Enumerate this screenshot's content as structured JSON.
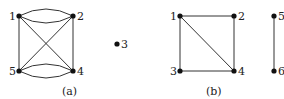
{
  "graphs": [
    {
      "caption": "(a)",
      "nodes": [
        {
          "id": "1",
          "label": "1",
          "x": 19,
          "y": 16
        },
        {
          "id": "2",
          "label": "2",
          "x": 73,
          "y": 16
        },
        {
          "id": "3",
          "label": "3",
          "x": 117,
          "y": 44
        },
        {
          "id": "4",
          "label": "4",
          "x": 73,
          "y": 71
        },
        {
          "id": "5",
          "label": "5",
          "x": 19,
          "y": 71
        }
      ],
      "edges": [
        {
          "from": "1",
          "to": "2",
          "type": "curve-up"
        },
        {
          "from": "1",
          "to": "2",
          "type": "curve-down"
        },
        {
          "from": "5",
          "to": "4",
          "type": "curve-up"
        },
        {
          "from": "5",
          "to": "4",
          "type": "curve-down"
        },
        {
          "from": "1",
          "to": "5",
          "type": "line"
        },
        {
          "from": "2",
          "to": "4",
          "type": "line"
        },
        {
          "from": "1",
          "to": "4",
          "type": "line"
        },
        {
          "from": "2",
          "to": "5",
          "type": "line"
        }
      ]
    },
    {
      "caption": "(b)",
      "nodes": [
        {
          "id": "1",
          "label": "1",
          "x": 180,
          "y": 16
        },
        {
          "id": "2",
          "label": "2",
          "x": 234,
          "y": 16
        },
        {
          "id": "3",
          "label": "3",
          "x": 180,
          "y": 71
        },
        {
          "id": "4",
          "label": "4",
          "x": 234,
          "y": 71
        },
        {
          "id": "5",
          "label": "5",
          "x": 274,
          "y": 16
        },
        {
          "id": "6",
          "label": "6",
          "x": 274,
          "y": 71
        }
      ],
      "edges": [
        {
          "from": "1",
          "to": "2",
          "type": "line"
        },
        {
          "from": "1",
          "to": "3",
          "type": "line"
        },
        {
          "from": "1",
          "to": "4",
          "type": "line"
        },
        {
          "from": "2",
          "to": "4",
          "type": "line"
        },
        {
          "from": "3",
          "to": "4",
          "type": "line"
        },
        {
          "from": "5",
          "to": "6",
          "type": "line"
        }
      ]
    }
  ]
}
